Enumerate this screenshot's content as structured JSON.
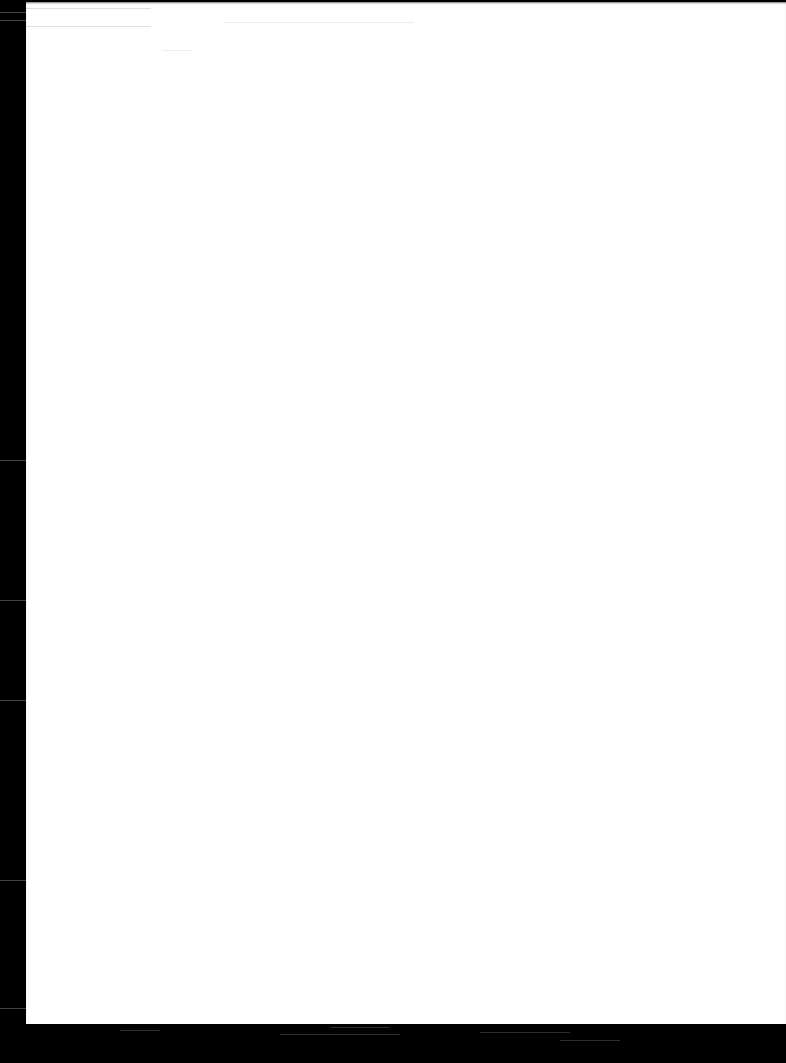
{
  "document": {
    "type": "scanned-page",
    "content": "",
    "background_color": "#ffffff",
    "border_color": "#000000"
  }
}
